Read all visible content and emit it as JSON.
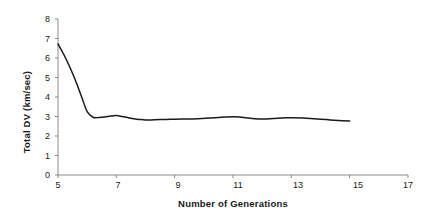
{
  "chart_data": {
    "type": "line",
    "title": "",
    "xlabel": "Number of Generations",
    "ylabel": "Total DV (km/sec)",
    "xlim": [
      5,
      17
    ],
    "ylim": [
      0,
      8
    ],
    "xticks": [
      5,
      7,
      9,
      11,
      13,
      15,
      17
    ],
    "yticks": [
      0,
      1,
      2,
      3,
      4,
      5,
      6,
      7,
      8
    ],
    "xtick_labels": [
      "5",
      "7",
      "9",
      "11",
      "13",
      "15",
      "17"
    ],
    "ytick_labels": [
      "0",
      "1",
      "2",
      "3",
      "4",
      "5",
      "6",
      "7",
      "8"
    ],
    "grid": false,
    "legend": null,
    "series": [
      {
        "name": "Total DV",
        "color": "#1a1a1a",
        "x": [
          5.0,
          5.2,
          5.4,
          5.6,
          5.8,
          6.0,
          6.2,
          6.4,
          6.6,
          6.8,
          7.0,
          7.2,
          7.4,
          7.6,
          7.8,
          8.0,
          8.3,
          8.7,
          9.0,
          9.4,
          9.8,
          10.2,
          10.6,
          11.0,
          11.3,
          11.6,
          12.0,
          12.4,
          12.8,
          13.0,
          13.4,
          13.8,
          14.2,
          14.6,
          15.0
        ],
        "y": [
          6.72,
          6.18,
          5.55,
          4.85,
          4.05,
          3.25,
          2.96,
          2.95,
          2.97,
          3.02,
          3.05,
          3.0,
          2.94,
          2.89,
          2.85,
          2.82,
          2.83,
          2.85,
          2.86,
          2.87,
          2.89,
          2.92,
          2.96,
          2.99,
          2.96,
          2.91,
          2.87,
          2.9,
          2.93,
          2.94,
          2.92,
          2.88,
          2.84,
          2.8,
          2.77
        ]
      }
    ]
  },
  "axes": {
    "y_title": "Total DV (km/sec)",
    "x_title": "Number of Generations"
  }
}
